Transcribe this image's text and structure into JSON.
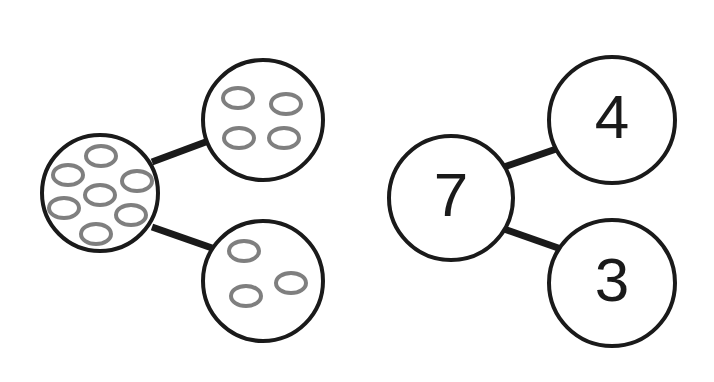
{
  "figure": {
    "background_color": "#ffffff",
    "stroke_color": "#1a1a1a",
    "counter_stroke_color": "#7f7f7f",
    "counter_fill_color": "#ffffff",
    "node_fill_color": "#ffffff",
    "circle_stroke_width": 4,
    "connector_stroke_width": 7,
    "counter_stroke_width": 4
  },
  "diagrams": [
    {
      "id": "pictorial",
      "name": "counter-number-bond",
      "representation": "counters",
      "whole": {
        "id": "whole-counters",
        "label": "whole",
        "count": 7,
        "cx": 100,
        "cy": 193,
        "r": 58,
        "counters": [
          {
            "cx": 101,
            "cy": 156,
            "rx": 15,
            "ry": 10
          },
          {
            "cx": 68,
            "cy": 175,
            "rx": 15,
            "ry": 10
          },
          {
            "cx": 137,
            "cy": 181,
            "rx": 15,
            "ry": 10
          },
          {
            "cx": 100,
            "cy": 195,
            "rx": 15,
            "ry": 10
          },
          {
            "cx": 64,
            "cy": 208,
            "rx": 15,
            "ry": 10
          },
          {
            "cx": 131,
            "cy": 215,
            "rx": 15,
            "ry": 10
          },
          {
            "cx": 96,
            "cy": 234,
            "rx": 15,
            "ry": 10
          }
        ]
      },
      "parts": [
        {
          "id": "part-counters-top",
          "label": "part",
          "count": 4,
          "cx": 263,
          "cy": 120,
          "r": 60,
          "counters": [
            {
              "cx": 238,
              "cy": 98,
              "rx": 15,
              "ry": 10
            },
            {
              "cx": 286,
              "cy": 104,
              "rx": 15,
              "ry": 10
            },
            {
              "cx": 239,
              "cy": 138,
              "rx": 15,
              "ry": 10
            },
            {
              "cx": 284,
              "cy": 138,
              "rx": 15,
              "ry": 10
            }
          ]
        },
        {
          "id": "part-counters-bottom",
          "label": "part",
          "count": 3,
          "cx": 263,
          "cy": 281,
          "r": 60,
          "counters": [
            {
              "cx": 244,
              "cy": 251,
              "rx": 15,
              "ry": 10
            },
            {
              "cx": 291,
              "cy": 283,
              "rx": 15,
              "ry": 10
            },
            {
              "cx": 246,
              "cy": 296,
              "rx": 15,
              "ry": 10
            }
          ]
        }
      ],
      "connectors": [
        {
          "id": "connector-counters-top",
          "x1": 152,
          "y1": 162,
          "x2": 211,
          "y2": 140
        },
        {
          "id": "connector-counters-bottom",
          "x1": 152,
          "y1": 227,
          "x2": 212,
          "y2": 248
        }
      ]
    },
    {
      "id": "symbolic",
      "name": "numeral-number-bond",
      "representation": "numerals",
      "whole": {
        "id": "whole-numeral",
        "label": "whole",
        "value": "7",
        "cx": 451,
        "cy": 198,
        "r": 62,
        "font_size": 62
      },
      "parts": [
        {
          "id": "part-numeral-top",
          "label": "part",
          "value": "4",
          "cx": 612,
          "cy": 120,
          "r": 63,
          "font_size": 62
        },
        {
          "id": "part-numeral-bottom",
          "label": "part",
          "value": "3",
          "cx": 612,
          "cy": 283,
          "r": 63,
          "font_size": 62
        }
      ],
      "connectors": [
        {
          "id": "connector-numeral-top",
          "x1": 504,
          "y1": 167,
          "x2": 562,
          "y2": 147
        },
        {
          "id": "connector-numeral-bottom",
          "x1": 504,
          "y1": 229,
          "x2": 561,
          "y2": 249
        }
      ]
    }
  ],
  "equation": {
    "whole": 7,
    "parts": [
      4,
      3
    ],
    "expression": "7 = 4 + 3"
  }
}
